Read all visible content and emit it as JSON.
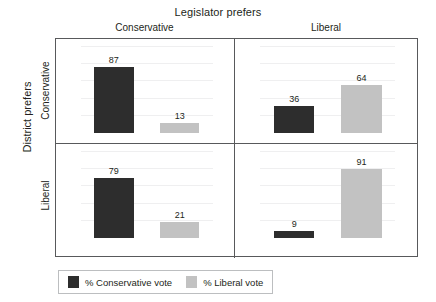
{
  "chart_data": {
    "type": "bar",
    "title": "",
    "layout": "2x2 panel (trellis) grouped bar chart",
    "col_group_title": "Legislator prefers",
    "row_group_title": "District prefers",
    "col_categories": [
      "Conservative",
      "Liberal"
    ],
    "row_categories": [
      "Conservative",
      "Liberal"
    ],
    "series": [
      {
        "name": "% Conservative vote",
        "color": "#2d2d2d"
      },
      {
        "name": "% Liberal vote",
        "color": "#c2c2c2"
      }
    ],
    "ylim": [
      0,
      100
    ],
    "grid": true,
    "gridlines": [
      20,
      40,
      60,
      80,
      100
    ],
    "legend_position": "bottom-left",
    "xlabel": "",
    "ylabel": "",
    "panels": [
      {
        "row": "Conservative",
        "col": "Conservative",
        "values": [
          87,
          13
        ],
        "labels": [
          "87",
          "13"
        ]
      },
      {
        "row": "Conservative",
        "col": "Liberal",
        "values": [
          36,
          64
        ],
        "labels": [
          "36",
          "64"
        ]
      },
      {
        "row": "Liberal",
        "col": "Conservative",
        "values": [
          79,
          21
        ],
        "labels": [
          "79",
          "21"
        ]
      },
      {
        "row": "Liberal",
        "col": "Liberal",
        "values": [
          9,
          91
        ],
        "labels": [
          "9",
          "91"
        ]
      }
    ]
  },
  "legend": {
    "items": [
      {
        "label": "% Conservative vote",
        "color": "#2d2d2d"
      },
      {
        "label": "% Liberal vote",
        "color": "#c2c2c2"
      }
    ]
  }
}
